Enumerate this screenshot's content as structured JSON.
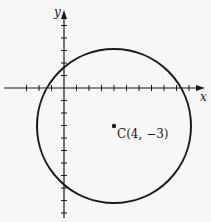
{
  "diagram": {
    "x_axis_label": "x",
    "y_axis_label": "y",
    "center_label": "C(4, −3)",
    "center": {
      "x": 4,
      "y": -3
    },
    "radius_units": 6.4,
    "origin_px": {
      "x": 64,
      "y": 88
    },
    "unit_px": 12.5,
    "x_ticks": [
      -3,
      -2,
      -1,
      1,
      2,
      3,
      4,
      5,
      6,
      7,
      8,
      9,
      10
    ],
    "y_ticks": [
      5,
      4,
      3,
      2,
      1,
      -1,
      -2,
      -3,
      -4,
      -5,
      -6,
      -7,
      -8,
      -9,
      -10
    ],
    "colors": {
      "ink": "#1a1a1a",
      "background": "#f7f7f5"
    }
  }
}
